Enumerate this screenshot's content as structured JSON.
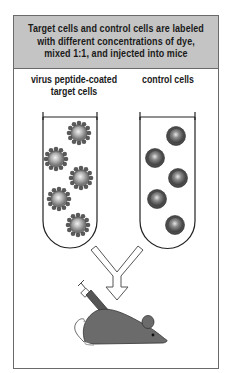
{
  "header": {
    "text": "Target cells and control cells are labeled\nwith different concentrations of dye,\nmixed 1:1, and injected into mice"
  },
  "tubes": [
    {
      "label": "virus peptide-coated\ntarget cells",
      "cell_type": "peptide-coated",
      "cell_count": 5
    },
    {
      "label": "control cells",
      "cell_type": "plain",
      "cell_count": 5
    }
  ],
  "colors": {
    "header_bg": "#c4c4c4",
    "frame": "#6a6a6a",
    "cell_dark": "#5a5a5a",
    "cell_light": "#d8d8d8",
    "mouse": "#6b6b6b"
  }
}
